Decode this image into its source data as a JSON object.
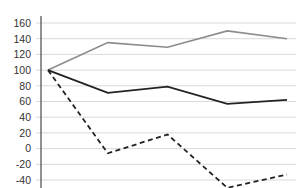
{
  "chart_data": {
    "type": "line",
    "title": "",
    "xlabel": "",
    "ylabel": "",
    "x": [
      1,
      2,
      3,
      4,
      5
    ],
    "ylim": [
      -40,
      160
    ],
    "yticks": [
      160,
      140,
      120,
      100,
      80,
      60,
      40,
      20,
      0,
      -20,
      -40
    ],
    "ytick_labels": [
      "160",
      "140",
      "120",
      "100",
      "80",
      "60",
      "40",
      "20",
      "0",
      "-20",
      "-40"
    ],
    "grid": true,
    "legend": null,
    "series": [
      {
        "name": "gray-solid",
        "style": "solid",
        "color": "#8c8c8c",
        "values": [
          100,
          135,
          129,
          150,
          140
        ]
      },
      {
        "name": "black-solid",
        "style": "solid",
        "color": "#222222",
        "values": [
          100,
          71,
          79,
          57,
          62
        ]
      },
      {
        "name": "black-dashed",
        "style": "dashed",
        "color": "#222222",
        "values": [
          100,
          -6,
          18,
          -50,
          -33
        ]
      }
    ]
  },
  "colors": {
    "grid": "#d9d9d9",
    "axis": "#555555",
    "text": "#333333"
  }
}
